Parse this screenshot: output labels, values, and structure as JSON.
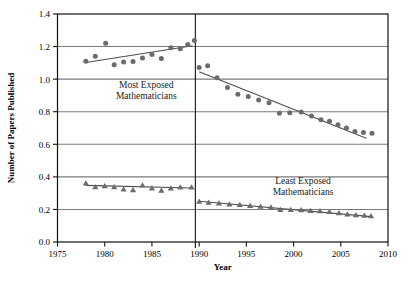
{
  "chart_data": {
    "type": "scatter",
    "title": "",
    "xlabel": "Year",
    "ylabel": "Number of Papers Published",
    "xlim": [
      1975,
      2010
    ],
    "ylim": [
      0.0,
      1.4
    ],
    "xticks": [
      1975,
      1980,
      1985,
      1990,
      1995,
      2000,
      2005,
      2010
    ],
    "xtick_labels": [
      "1975",
      "1980",
      "1985",
      "1990",
      "1995",
      "2000",
      "2005",
      "2010"
    ],
    "yticks": [
      0.0,
      0.2,
      0.4,
      0.6,
      0.8,
      1.0,
      1.2,
      1.4
    ],
    "ytick_labels": [
      "0.0",
      "0.2",
      "0.4",
      "0.6",
      "0.8",
      "1.0",
      "1.2",
      "1.4"
    ],
    "grid": "horizontal",
    "legend_position": "inline-annotations",
    "vertical_divider_x": 1989.6,
    "marker_color": "#6b6b6b",
    "line_color": "#4d4d4d",
    "grid_color": "#7a7a7a",
    "axis_color": "#111111",
    "annotations": [
      {
        "id": "most-exposed-label",
        "text_line1": "Most Exposed",
        "text_line2": "Mathematicians",
        "x": 1984.4,
        "y": 0.945
      },
      {
        "id": "least-exposed-label",
        "text_line1": "Least Exposed",
        "text_line2": "Mathematicians",
        "x": 2001.0,
        "y": 0.355
      }
    ],
    "series": [
      {
        "name": "Most Exposed Mathematicians (pre-1990)",
        "marker": "circle",
        "points": [
          {
            "x": 1978.0,
            "y": 1.11
          },
          {
            "x": 1979.0,
            "y": 1.14
          },
          {
            "x": 1980.1,
            "y": 1.22
          },
          {
            "x": 1981.0,
            "y": 1.088
          },
          {
            "x": 1982.0,
            "y": 1.105
          },
          {
            "x": 1983.0,
            "y": 1.108
          },
          {
            "x": 1984.0,
            "y": 1.13
          },
          {
            "x": 1985.0,
            "y": 1.152
          },
          {
            "x": 1986.0,
            "y": 1.126
          },
          {
            "x": 1987.0,
            "y": 1.192
          },
          {
            "x": 1988.0,
            "y": 1.186
          },
          {
            "x": 1988.8,
            "y": 1.212
          },
          {
            "x": 1989.5,
            "y": 1.238
          }
        ],
        "trend": {
          "x1": 1978.0,
          "y1": 1.102,
          "x2": 1989.3,
          "y2": 1.205
        }
      },
      {
        "name": "Most Exposed Mathematicians (post-1990)",
        "marker": "circle",
        "points": [
          {
            "x": 1990.0,
            "y": 1.072
          },
          {
            "x": 1990.9,
            "y": 1.083
          },
          {
            "x": 1991.9,
            "y": 1.008
          },
          {
            "x": 1993.0,
            "y": 0.948
          },
          {
            "x": 1994.1,
            "y": 0.907
          },
          {
            "x": 1995.2,
            "y": 0.893
          },
          {
            "x": 1996.3,
            "y": 0.872
          },
          {
            "x": 1997.4,
            "y": 0.855
          },
          {
            "x": 1998.5,
            "y": 0.79
          },
          {
            "x": 1999.6,
            "y": 0.793
          },
          {
            "x": 2000.8,
            "y": 0.798
          },
          {
            "x": 2001.9,
            "y": 0.774
          },
          {
            "x": 2002.9,
            "y": 0.751
          },
          {
            "x": 2003.8,
            "y": 0.742
          },
          {
            "x": 2004.7,
            "y": 0.72
          },
          {
            "x": 2005.6,
            "y": 0.7
          },
          {
            "x": 2006.5,
            "y": 0.678
          },
          {
            "x": 2007.4,
            "y": 0.672
          },
          {
            "x": 2008.3,
            "y": 0.668
          }
        ],
        "trend": {
          "x1": 1990.0,
          "y1": 1.046,
          "x2": 2007.7,
          "y2": 0.637
        }
      },
      {
        "name": "Least Exposed Mathematicians (pre-1990)",
        "marker": "triangle",
        "points": [
          {
            "x": 1978.0,
            "y": 0.36
          },
          {
            "x": 1979.0,
            "y": 0.338
          },
          {
            "x": 1980.0,
            "y": 0.344
          },
          {
            "x": 1981.0,
            "y": 0.338
          },
          {
            "x": 1982.0,
            "y": 0.324
          },
          {
            "x": 1983.0,
            "y": 0.32
          },
          {
            "x": 1984.0,
            "y": 0.348
          },
          {
            "x": 1985.0,
            "y": 0.33
          },
          {
            "x": 1986.0,
            "y": 0.316
          },
          {
            "x": 1987.0,
            "y": 0.33
          },
          {
            "x": 1988.0,
            "y": 0.336
          },
          {
            "x": 1989.2,
            "y": 0.336
          }
        ],
        "trend": {
          "x1": 1978.0,
          "y1": 0.348,
          "x2": 1989.2,
          "y2": 0.332
        }
      },
      {
        "name": "Least Exposed Mathematicians (post-1990)",
        "marker": "triangle",
        "points": [
          {
            "x": 1990.0,
            "y": 0.248
          },
          {
            "x": 1991.0,
            "y": 0.243
          },
          {
            "x": 1992.1,
            "y": 0.238
          },
          {
            "x": 1993.2,
            "y": 0.232
          },
          {
            "x": 1994.3,
            "y": 0.228
          },
          {
            "x": 1995.4,
            "y": 0.222
          },
          {
            "x": 1996.5,
            "y": 0.218
          },
          {
            "x": 1997.6,
            "y": 0.214
          },
          {
            "x": 1998.6,
            "y": 0.198
          },
          {
            "x": 1999.7,
            "y": 0.198
          },
          {
            "x": 2000.8,
            "y": 0.196
          },
          {
            "x": 2001.8,
            "y": 0.192
          },
          {
            "x": 2002.8,
            "y": 0.19
          },
          {
            "x": 2003.8,
            "y": 0.186
          },
          {
            "x": 2004.8,
            "y": 0.178
          },
          {
            "x": 2005.7,
            "y": 0.17
          },
          {
            "x": 2006.6,
            "y": 0.166
          },
          {
            "x": 2007.5,
            "y": 0.162
          },
          {
            "x": 2008.2,
            "y": 0.16
          }
        ],
        "trend": {
          "x1": 1990.0,
          "y1": 0.25,
          "x2": 2008.2,
          "y2": 0.156
        }
      }
    ]
  }
}
